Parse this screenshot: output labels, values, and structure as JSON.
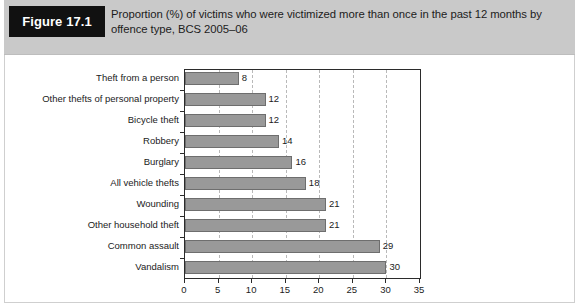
{
  "figure": {
    "tag_label": "Figure 17.1",
    "caption": "Proportion (%) of victims who were victimized more than once in the past 12 months by offence type, BCS 2005–06"
  },
  "chart_data": {
    "type": "bar",
    "orientation": "horizontal",
    "title": "Proportion (%) of victims who were victimized more than once in the past 12 months by offence type, BCS 2005–06",
    "xlabel": "",
    "ylabel": "",
    "xlim": [
      0,
      35
    ],
    "ylim": null,
    "grid": "vertical-dashed",
    "legend": "none",
    "xticks": [
      0,
      5,
      10,
      15,
      20,
      25,
      30,
      35
    ],
    "xtick_labels": [
      "0",
      "5",
      "10",
      "15",
      "20",
      "25",
      "30",
      "35"
    ],
    "categories": [
      "Theft from a person",
      "Other thefts of personal property",
      "Bicycle theft",
      "Robbery",
      "Burglary",
      "All vehicle thefts",
      "Wounding",
      "Other household theft",
      "Common assault",
      "Vandalism"
    ],
    "values": [
      8,
      12,
      12,
      14,
      16,
      18,
      21,
      21,
      29,
      30
    ],
    "value_labels": [
      "8",
      "12",
      "12",
      "14",
      "16",
      "18",
      "21",
      "21",
      "29",
      "30"
    ],
    "bar_color": "#999999",
    "bar_border_color": "#6e6e6e",
    "axis_color": "#2b2b2b",
    "grid_color": "#b9b9b9",
    "header_background": "#c9c9c9",
    "tag_background": "#111111",
    "tag_color": "#ffffff"
  }
}
